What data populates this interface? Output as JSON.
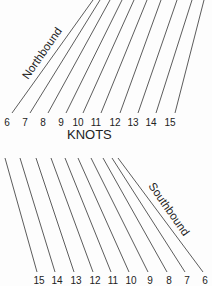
{
  "diagram": {
    "axis_title": "KNOTS",
    "northbound": {
      "label": "Northbound",
      "lines": [
        {
          "knots": "6",
          "x1": 12,
          "y1": 113,
          "x2": 93,
          "y2": 0
        },
        {
          "knots": "7",
          "x1": 30,
          "y1": 113,
          "x2": 100,
          "y2": 0
        },
        {
          "knots": "8",
          "x1": 48,
          "y1": 113,
          "x2": 110,
          "y2": 0
        },
        {
          "knots": "9",
          "x1": 66,
          "y1": 113,
          "x2": 122,
          "y2": 0
        },
        {
          "knots": "10",
          "x1": 83,
          "y1": 113,
          "x2": 134,
          "y2": 0
        },
        {
          "knots": "11",
          "x1": 101,
          "y1": 113,
          "x2": 147,
          "y2": 0
        },
        {
          "knots": "12",
          "x1": 120,
          "y1": 113,
          "x2": 161,
          "y2": 0
        },
        {
          "knots": "13",
          "x1": 138,
          "y1": 113,
          "x2": 177,
          "y2": 0
        },
        {
          "knots": "14",
          "x1": 156,
          "y1": 113,
          "x2": 192,
          "y2": 0
        },
        {
          "knots": "15",
          "x1": 175,
          "y1": 113,
          "x2": 204,
          "y2": 0
        }
      ]
    },
    "southbound": {
      "label": "Southbound",
      "lines": [
        {
          "knots": "15",
          "x1": 5,
          "y1": 158,
          "x2": 37,
          "y2": 272
        },
        {
          "knots": "14",
          "x1": 20,
          "y1": 158,
          "x2": 55,
          "y2": 272
        },
        {
          "knots": "13",
          "x1": 36,
          "y1": 158,
          "x2": 74,
          "y2": 272
        },
        {
          "knots": "12",
          "x1": 51,
          "y1": 158,
          "x2": 93,
          "y2": 272
        },
        {
          "knots": "11",
          "x1": 65,
          "y1": 158,
          "x2": 111,
          "y2": 272
        },
        {
          "knots": "10",
          "x1": 78,
          "y1": 158,
          "x2": 129,
          "y2": 272
        },
        {
          "knots": "9",
          "x1": 91,
          "y1": 158,
          "x2": 148,
          "y2": 272
        },
        {
          "knots": "8",
          "x1": 103,
          "y1": 158,
          "x2": 167,
          "y2": 272
        },
        {
          "knots": "7",
          "x1": 112,
          "y1": 158,
          "x2": 185,
          "y2": 272
        },
        {
          "knots": "6",
          "x1": 118,
          "y1": 158,
          "x2": 203,
          "y2": 272
        }
      ]
    }
  }
}
